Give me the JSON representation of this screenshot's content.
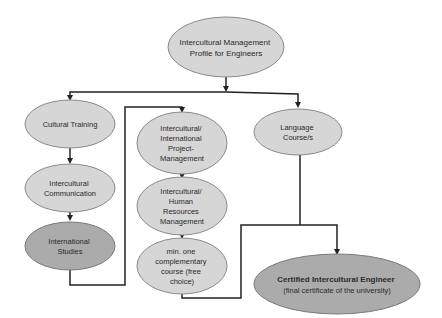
{
  "diagram": {
    "colors": {
      "light_fill": "#d6d6d6",
      "dark_fill": "#ababab",
      "stroke": "#7a7a7a",
      "connector": "#222222"
    },
    "nodes": {
      "profile": {
        "lines": [
          "Intercultural Management",
          "Profile for Engineers"
        ]
      },
      "cultural_training": {
        "lines": [
          "Cultural Training"
        ]
      },
      "intercultural_communication": {
        "lines": [
          "Intercultural",
          "Communication"
        ]
      },
      "international_studies": {
        "lines": [
          "International",
          "Studies"
        ]
      },
      "project_management": {
        "lines": [
          "Intercultural/",
          "International",
          "Project-",
          "Management"
        ]
      },
      "hr_management": {
        "lines": [
          "Intercultural/",
          "Human",
          "Resources",
          "Management"
        ]
      },
      "complementary_course": {
        "lines": [
          "min. one",
          "complementary",
          "course (free",
          "choice)"
        ]
      },
      "language_course": {
        "lines": [
          "Language",
          "Course/s"
        ]
      },
      "certified_engineer": {
        "lines": [
          "Certified Intercultural Engineer",
          "(final certificate of the university)"
        ]
      }
    }
  }
}
